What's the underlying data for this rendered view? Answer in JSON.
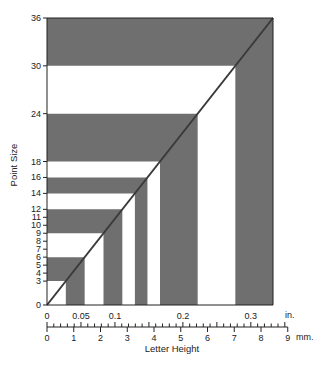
{
  "chart_data": {
    "type": "area",
    "title": "",
    "xlabel": "Letter Height",
    "ylabel": "Point Size",
    "ylim": [
      0,
      36
    ],
    "xlim_mm": [
      0,
      9
    ],
    "y_ticks": [
      0,
      3,
      4,
      5,
      6,
      7,
      8,
      9,
      10,
      11,
      12,
      14,
      16,
      18,
      24,
      30,
      36
    ],
    "x_ticks_mm": [
      0,
      1,
      2,
      3,
      4,
      5,
      6,
      7,
      8,
      9
    ],
    "x_ticks_in": [
      0,
      0.05,
      0.1,
      0.2,
      0.3
    ],
    "x_unit_mm": "mm.",
    "x_unit_in": "in.",
    "bands": [
      {
        "from": 0,
        "to": 3,
        "fill": "white"
      },
      {
        "from": 3,
        "to": 6,
        "fill": "gray"
      },
      {
        "from": 6,
        "to": 9,
        "fill": "white"
      },
      {
        "from": 9,
        "to": 12,
        "fill": "gray"
      },
      {
        "from": 12,
        "to": 14,
        "fill": "white"
      },
      {
        "from": 14,
        "to": 16,
        "fill": "gray"
      },
      {
        "from": 16,
        "to": 18,
        "fill": "white"
      },
      {
        "from": 18,
        "to": 24,
        "fill": "gray"
      },
      {
        "from": 24,
        "to": 30,
        "fill": "white"
      },
      {
        "from": 30,
        "to": 36,
        "fill": "gray"
      }
    ],
    "diagonal": {
      "from": [
        0,
        0
      ],
      "to": [
        8.47,
        36
      ],
      "unit": "mm vs pt"
    },
    "colors": {
      "band": "#6f6f6f",
      "diagonal": "#3a3a3a",
      "axis": "#222222"
    }
  },
  "labels": {
    "y_title": "Point Size",
    "x_title": "Letter Height",
    "mm_unit": "mm.",
    "in_unit": "in."
  }
}
